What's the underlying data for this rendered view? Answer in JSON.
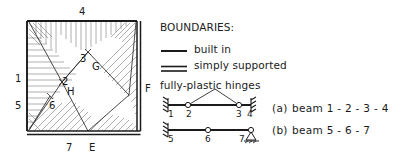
{
  "figure": {
    "type": "yield-line-mechanism-diagram",
    "slab": {
      "shape": "square",
      "edge_labels": {
        "top": "4",
        "left_upper": "1",
        "left_lower": "5",
        "bottom_left": "7",
        "right": "F",
        "bottom_mid": "E"
      },
      "interior_nodes": [
        {
          "label": "3"
        },
        {
          "label": "G"
        },
        {
          "label": "2"
        },
        {
          "label": "H"
        },
        {
          "label": "6"
        }
      ],
      "boundary_conditions": {
        "top": "built in",
        "left": "built in",
        "right": "simply supported",
        "bottom": "simply supported"
      }
    },
    "legend": {
      "title": "BOUNDARIES:",
      "entries": [
        {
          "symbol": "single-line",
          "label": "built in"
        },
        {
          "symbol": "double-line",
          "label": "simply supported"
        }
      ],
      "hinges_title": "fully-plastic hinges"
    },
    "beams": [
      {
        "tag": "(a)",
        "caption": "beam  1 - 2 - 3 - 4",
        "nodes": [
          "1",
          "2",
          "3",
          "4"
        ],
        "left_support": "built in",
        "right_support": "built in",
        "hinges": [
          "2",
          "3"
        ],
        "mechanism": "peak between 2 and 3"
      },
      {
        "tag": "(b)",
        "caption": "beam  5 - 6 - 7",
        "nodes": [
          "5",
          "6",
          "7"
        ],
        "left_support": "built in",
        "right_support": "simply supported",
        "hinges": [
          "6"
        ],
        "mechanism": "flat"
      }
    ]
  },
  "colors": {
    "ink": "#1a1a1a",
    "hatch": "#707070",
    "background": "#ffffff"
  }
}
